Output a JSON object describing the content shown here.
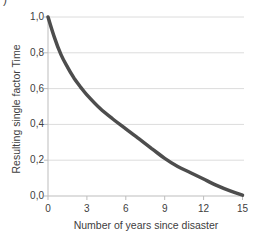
{
  "figure": {
    "corner_mark": ")",
    "colors": {
      "background": "#ffffff",
      "curve": "#4d4d4d",
      "grid": "#dcdcdc",
      "axis": "#bdbdbd",
      "text": "#404040"
    }
  },
  "chart_data": {
    "type": "line",
    "title": "",
    "xlabel": "Number of years since disaster",
    "ylabel": "Resulting single factor Time",
    "xlim": [
      0,
      15
    ],
    "ylim": [
      0,
      1
    ],
    "x_ticks": [
      0,
      3,
      6,
      9,
      12,
      15
    ],
    "x_tick_labels": [
      "0",
      "3",
      "6",
      "9",
      "12",
      "15"
    ],
    "y_ticks": [
      0,
      0.2,
      0.4,
      0.6,
      0.8,
      1.0
    ],
    "y_tick_labels": [
      "0,0",
      "0,2",
      "0,4",
      "0,6",
      "0,8",
      "1,0"
    ],
    "grid": "horizontal",
    "legend": "none",
    "series": [
      {
        "name": "resulting-single-factor-time",
        "x": [
          0,
          0.5,
          1,
          1.5,
          2,
          2.5,
          3,
          4,
          5,
          6,
          7,
          8,
          9,
          10,
          11,
          12,
          13,
          14,
          15
        ],
        "y": [
          1.0,
          0.885,
          0.79,
          0.72,
          0.66,
          0.61,
          0.565,
          0.49,
          0.43,
          0.375,
          0.32,
          0.265,
          0.21,
          0.165,
          0.13,
          0.095,
          0.06,
          0.03,
          0.005
        ]
      }
    ]
  }
}
